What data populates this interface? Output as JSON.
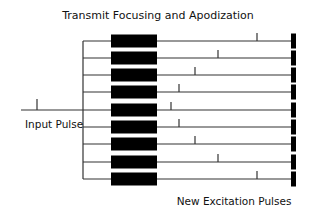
{
  "title": "Transmit Focusing and Apodization",
  "labels": {
    "input": "Input Pulse",
    "output": "New Excitation Pulses"
  },
  "colors": {
    "ink": "#000000",
    "line": "#333333",
    "background": "#ffffff"
  },
  "input_pulse": {
    "line_y": 110,
    "x_start": 21,
    "x_end": 83,
    "tick_x": 37
  },
  "bus_x": 83,
  "delay_box": {
    "x": 111,
    "width": 46,
    "height": 13
  },
  "output_block": {
    "x": 291,
    "width": 5,
    "height": 15
  },
  "channels": [
    {
      "index": 1,
      "y": 41,
      "tick_x": 257
    },
    {
      "index": 2,
      "y": 58,
      "tick_x": 218
    },
    {
      "index": 3,
      "y": 75,
      "tick_x": 195
    },
    {
      "index": 4,
      "y": 92,
      "tick_x": 179
    },
    {
      "index": 5,
      "y": 110,
      "tick_x": 171
    },
    {
      "index": 6,
      "y": 127,
      "tick_x": 179
    },
    {
      "index": 7,
      "y": 144,
      "tick_x": 195
    },
    {
      "index": 8,
      "y": 162,
      "tick_x": 218
    },
    {
      "index": 9,
      "y": 179,
      "tick_x": 257
    }
  ]
}
